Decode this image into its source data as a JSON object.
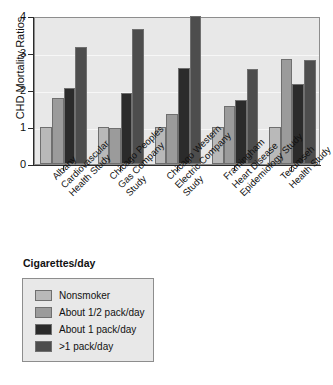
{
  "chart_data": {
    "type": "bar",
    "title": "",
    "xlabel": "",
    "ylabel": "CHD Mortality Ratios",
    "ylim": [
      0,
      4
    ],
    "yticks": [
      "0",
      "1",
      "2",
      "3",
      "4"
    ],
    "grid": true,
    "legend_position": "below-plot-left",
    "legend_title": "Cigarettes/day",
    "categories": [
      "Albany\nCardiovascular\nHealth Study",
      "Chicago Peoples\nGas Company\nStudy",
      "Chicago Western\nElectric Company\nStudy",
      "Framingham\nHeart Disease\nEpidemiology Study",
      "Tecumseh\nHealth Study"
    ],
    "category_lines": [
      [
        "Albany",
        "Cardiovascular",
        "Health Study"
      ],
      [
        "Chicago Peoples",
        "Gas Company",
        "Study"
      ],
      [
        "Chicago Western",
        "Electric Company",
        "Study"
      ],
      [
        "Framingham",
        "Heart Disease",
        "Epidemiology Study"
      ],
      [
        "Tecumseh",
        "Health Study"
      ]
    ],
    "series": [
      {
        "name": "Nonsmoker",
        "color": "#b9b9b9",
        "values": [
          1.0,
          1.0,
          1.0,
          1.0,
          1.0
        ]
      },
      {
        "name": "About 1/2 pack/day",
        "color": "#9b9b9b",
        "values": [
          1.78,
          0.96,
          1.34,
          1.58,
          2.83
        ]
      },
      {
        "name": "About 1 pack/day",
        "color": "#2b2b2b",
        "values": [
          2.05,
          1.92,
          2.59,
          1.74,
          2.17
        ]
      },
      {
        "name": ">1 pack/day",
        "color": "#4d4d4d",
        "values": [
          3.17,
          3.66,
          4.0,
          2.56,
          2.8
        ]
      }
    ]
  },
  "legend": {
    "title": "Cigarettes/day",
    "entries": [
      {
        "label": "Nonsmoker",
        "color": "#b9b9b9"
      },
      {
        "label": "About 1/2 pack/day",
        "color": "#9b9b9b"
      },
      {
        "label": "About 1 pack/day",
        "color": "#2b2b2b"
      },
      {
        "label": ">1 pack/day",
        "color": "#4d4d4d"
      }
    ]
  },
  "axes": {
    "y_title": "CHD Mortality Ratios",
    "y_ticks": [
      "0",
      "1",
      "2",
      "3",
      "4"
    ]
  }
}
